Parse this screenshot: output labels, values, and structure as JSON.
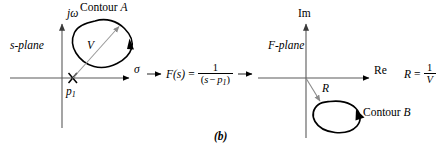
{
  "figure": {
    "caption": "(b)",
    "type": "conformal-mapping-diagram"
  },
  "s_plane": {
    "name": "s-plane",
    "vertical_axis_label": "jω",
    "horizontal_axis_label": "σ",
    "pole_marker": "×",
    "pole_label": "p",
    "pole_subscript": "1",
    "contour_label": "Contour",
    "contour_name": "A",
    "vector_label": "V",
    "contour_direction": "clockwise"
  },
  "transform": {
    "function_name": "F(s)",
    "equals": "=",
    "numerator": "1",
    "denominator_open": "(",
    "denominator_s": "s",
    "denominator_minus": "−",
    "denominator_p": "p",
    "denominator_sub": "1",
    "denominator_close": ")",
    "arrow_in": "▶",
    "arrow_out": "▶"
  },
  "f_plane": {
    "name": "F-plane",
    "vertical_axis_label": "Im",
    "horizontal_axis_label": "Re",
    "contour_label": "Contour",
    "contour_name": "B",
    "vector_label": "R",
    "relation_lhs": "R",
    "relation_equals": "=",
    "relation_numerator": "1",
    "relation_denominator": "V",
    "contour_direction": "counterclockwise"
  },
  "colors": {
    "ink": "#000000",
    "vector_gray": "#8a8a8a",
    "axis_gray": "#5a5a5a",
    "background": "#ffffff"
  }
}
